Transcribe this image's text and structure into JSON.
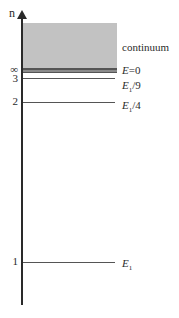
{
  "diagram": {
    "type": "energy-level-diagram",
    "axis_label": "n",
    "continuum_label": "continuum",
    "colors": {
      "continuum": "#c2c2c2",
      "band": "#6a6a6a",
      "lines": "#555555",
      "axis": "#2a2a2a"
    },
    "levels": [
      {
        "n": "∞",
        "energy_label": "E=0",
        "y": 70
      },
      {
        "n": "3",
        "energy_label": "E1/9",
        "y": 78
      },
      {
        "n": "2",
        "energy_label": "E1/4",
        "y": 102
      },
      {
        "n": "1",
        "energy_label": "E1",
        "y": 262
      }
    ],
    "labels": {
      "inf": "∞",
      "n3": "3",
      "n2": "2",
      "n1": "1",
      "e0_E": "E",
      "e0_rest": "=0",
      "e9_E": "E",
      "e9_sub": "1",
      "e9_rest": "/9",
      "e4_E": "E",
      "e4_sub": "1",
      "e4_rest": "/4",
      "e1_E": "E",
      "e1_sub": "1"
    }
  }
}
